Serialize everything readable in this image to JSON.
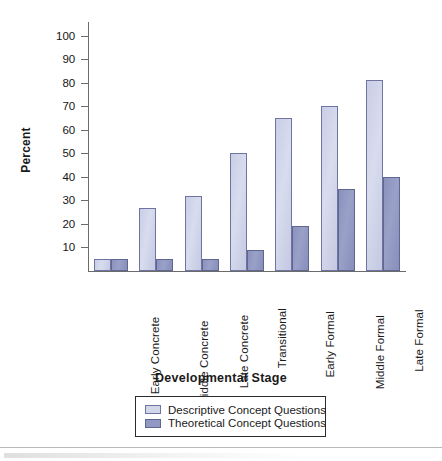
{
  "chart_data": {
    "type": "bar",
    "title": "",
    "xlabel": "Developmental Stage",
    "ylabel": "Percent",
    "categories": [
      "Early Concrete",
      "Middle Concrete",
      "Late Concrete",
      "Transitional",
      "Early Formal",
      "Middle Formal",
      "Late Formal"
    ],
    "series": [
      {
        "name": "Descriptive Concept Questions",
        "color": "#d2d7ea",
        "values": [
          5,
          27,
          32,
          50,
          65,
          70,
          81
        ]
      },
      {
        "name": "Theoretical Concept Questions",
        "color": "#9198c3",
        "values": [
          5,
          5,
          5,
          9,
          19,
          35,
          40
        ]
      }
    ],
    "ylim": [
      0,
      105
    ],
    "yticks": [
      10,
      20,
      30,
      40,
      50,
      60,
      70,
      80,
      90,
      100
    ],
    "ytick_labels": [
      "10",
      "20",
      "30",
      "40",
      "50",
      "60",
      "70",
      "80",
      "90",
      "100"
    ],
    "grid": false,
    "legend_position": "bottom-center"
  },
  "axes": {
    "y_title": "Percent",
    "x_title": "Developmental Stage"
  },
  "legend": {
    "entries": [
      {
        "label": "Descriptive Concept Questions",
        "color": "#d2d7ea"
      },
      {
        "label": "Theoretical Concept Questions",
        "color": "#9198c3"
      }
    ]
  }
}
